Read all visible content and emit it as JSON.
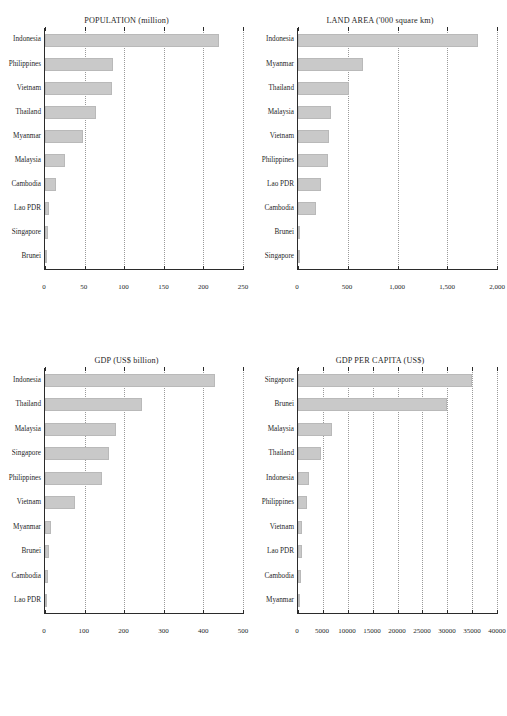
{
  "figure": {
    "background": "#ffffff",
    "bar_color": "#c9c9c9",
    "axis_color": "#2b2b2b",
    "gridline_color": "#9a9a9a",
    "panel_count": 4
  },
  "chart_data": [
    {
      "type": "bar",
      "orientation": "horizontal",
      "title": "POPULATION (million)",
      "xlabel": "",
      "ylabel": "",
      "grid": true,
      "legend": "none",
      "xlim": [
        0,
        250
      ],
      "ticks": [
        0,
        50,
        100,
        150,
        200,
        250
      ],
      "tick_labels": [
        "0",
        "50",
        "100",
        "150",
        "200",
        "250"
      ],
      "categories": [
        "Indonesia",
        "Philippines",
        "Vietnam",
        "Thailand",
        "Myanmar",
        "Malaysia",
        "Cambodia",
        "Lao PDR",
        "Singapore",
        "Brunei"
      ],
      "values": [
        220,
        86,
        84,
        64,
        48,
        25,
        14,
        5.5,
        4,
        0.4
      ]
    },
    {
      "type": "bar",
      "orientation": "horizontal",
      "title": "LAND AREA ('000 square km)",
      "xlabel": "",
      "ylabel": "",
      "grid": true,
      "legend": "none",
      "xlim": [
        0,
        2000
      ],
      "ticks": [
        0,
        500,
        1000,
        1500,
        2000
      ],
      "tick_labels": [
        "0",
        "500",
        "1,000",
        "1,500",
        "2,000"
      ],
      "categories": [
        "Indonesia",
        "Myanmar",
        "Thailand",
        "Malaysia",
        "Vietnam",
        "Philippines",
        "Lao PDR",
        "Cambodia",
        "Brunei",
        "Singapore"
      ],
      "values": [
        1812,
        654,
        511,
        329,
        310,
        298,
        231,
        177,
        5.3,
        0.7
      ]
    },
    {
      "type": "bar",
      "orientation": "horizontal",
      "title": "GDP (US$ billion)",
      "xlabel": "",
      "ylabel": "",
      "grid": true,
      "legend": "none",
      "xlim": [
        0,
        500
      ],
      "ticks": [
        0,
        100,
        200,
        300,
        400,
        500
      ],
      "tick_labels": [
        "0",
        "100",
        "200",
        "300",
        "400",
        "500"
      ],
      "categories": [
        "Indonesia",
        "Thailand",
        "Malaysia",
        "Singapore",
        "Philippines",
        "Vietnam",
        "Myanmar",
        "Brunei",
        "Cambodia",
        "Lao PDR"
      ],
      "values": [
        430,
        246,
        180,
        162,
        144,
        76,
        16,
        9,
        7,
        3
      ]
    },
    {
      "type": "bar",
      "orientation": "horizontal",
      "title": "GDP PER CAPITA (US$)",
      "xlabel": "",
      "ylabel": "",
      "grid": true,
      "legend": "none",
      "xlim": [
        0,
        40000
      ],
      "ticks": [
        0,
        5000,
        10000,
        15000,
        20000,
        25000,
        30000,
        35000,
        40000
      ],
      "tick_labels": [
        "0",
        "5000",
        "10000",
        "15000",
        "20000",
        "25000",
        "30000",
        "35000",
        "40000"
      ],
      "categories": [
        "Singapore",
        "Brunei",
        "Malaysia",
        "Thailand",
        "Indonesia",
        "Philippines",
        "Vietnam",
        "Lao PDR",
        "Cambodia",
        "Myanmar"
      ],
      "values": [
        35000,
        30000,
        6900,
        4700,
        2300,
        1900,
        900,
        800,
        700,
        400
      ]
    }
  ]
}
